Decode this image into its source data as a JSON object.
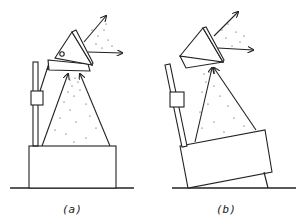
{
  "panels": [
    {
      "id": "a",
      "caption": "(a)",
      "description": "Upright base with stand and angled reflector emitting particles"
    },
    {
      "id": "b",
      "caption": "(b)",
      "description": "Tilted base with stand and angled reflector emitting particles"
    }
  ],
  "colors": {
    "line": "#222222",
    "background": "#ffffff"
  }
}
